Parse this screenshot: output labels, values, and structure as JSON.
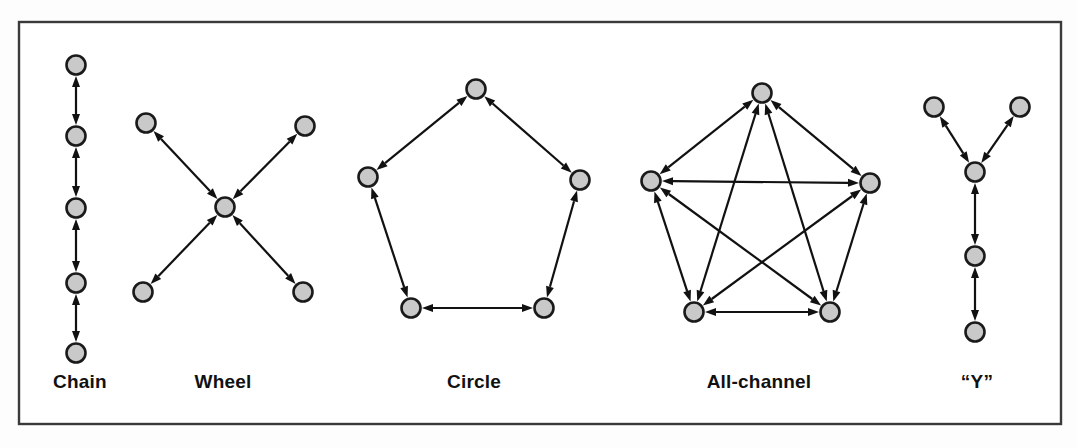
{
  "figure": {
    "background_color": "#fdfdfd",
    "frame": {
      "name": "figure-border",
      "stroke_color": "#3a3a3a",
      "fill_color": "#ffffff",
      "x": 19,
      "y": 22,
      "width": 1042,
      "height": 402
    },
    "style": {
      "node_fill": "#c9c9c9",
      "node_stroke": "#1a1a1a",
      "node_radius": 9.5,
      "node_stroke_width": 2.6,
      "edge_color": "#111111",
      "edge_width": 2.2,
      "arrow_color": "#111111",
      "label_color": "#111111"
    }
  },
  "networks": [
    {
      "id": "chain",
      "label": "Chain",
      "label_x": 80,
      "label_y": 388,
      "description": "Five nodes in a vertical line, each adjacent pair linked by a two-way arrow",
      "node_count": 5,
      "edge_count": 4,
      "nodes": [
        {
          "id": "c1",
          "x": 76,
          "y": 65
        },
        {
          "id": "c2",
          "x": 76,
          "y": 136
        },
        {
          "id": "c3",
          "x": 76,
          "y": 208
        },
        {
          "id": "c4",
          "x": 76,
          "y": 283
        },
        {
          "id": "c5",
          "x": 76,
          "y": 353
        }
      ],
      "edges": [
        {
          "from": "c1",
          "to": "c2",
          "bidirectional": true
        },
        {
          "from": "c2",
          "to": "c3",
          "bidirectional": true
        },
        {
          "from": "c3",
          "to": "c4",
          "bidirectional": true
        },
        {
          "from": "c4",
          "to": "c5",
          "bidirectional": true
        }
      ]
    },
    {
      "id": "wheel",
      "label": "Wheel",
      "label_x": 223,
      "label_y": 388,
      "description": "One central node linked by two-way arrows to four peripheral nodes arranged in an X",
      "node_count": 5,
      "edge_count": 4,
      "nodes": [
        {
          "id": "w_center",
          "x": 225,
          "y": 207
        },
        {
          "id": "w_tl",
          "x": 146,
          "y": 123
        },
        {
          "id": "w_tr",
          "x": 305,
          "y": 126
        },
        {
          "id": "w_bl",
          "x": 143,
          "y": 292
        },
        {
          "id": "w_br",
          "x": 303,
          "y": 292
        }
      ],
      "edges": [
        {
          "from": "w_center",
          "to": "w_tl",
          "bidirectional": true
        },
        {
          "from": "w_center",
          "to": "w_tr",
          "bidirectional": true
        },
        {
          "from": "w_center",
          "to": "w_bl",
          "bidirectional": true
        },
        {
          "from": "w_center",
          "to": "w_br",
          "bidirectional": true
        }
      ]
    },
    {
      "id": "circle",
      "label": "Circle",
      "label_x": 474,
      "label_y": 388,
      "description": "Five nodes on a pentagon ring, each linked to its two neighbours by two-way arrows",
      "node_count": 5,
      "edge_count": 5,
      "nodes": [
        {
          "id": "r_top",
          "x": 476,
          "y": 89
        },
        {
          "id": "r_left",
          "x": 368,
          "y": 177
        },
        {
          "id": "r_right",
          "x": 580,
          "y": 180
        },
        {
          "id": "r_bl",
          "x": 411,
          "y": 308
        },
        {
          "id": "r_br",
          "x": 544,
          "y": 308
        }
      ],
      "edges": [
        {
          "from": "r_top",
          "to": "r_left",
          "bidirectional": true
        },
        {
          "from": "r_top",
          "to": "r_right",
          "bidirectional": true
        },
        {
          "from": "r_left",
          "to": "r_bl",
          "bidirectional": true
        },
        {
          "from": "r_right",
          "to": "r_br",
          "bidirectional": true
        },
        {
          "from": "r_bl",
          "to": "r_br",
          "bidirectional": true
        }
      ]
    },
    {
      "id": "all-channel",
      "label": "All-channel",
      "label_x": 759,
      "label_y": 388,
      "description": "Five nodes fully connected: every pair linked by a two-way arrow",
      "node_count": 5,
      "edge_count": 10,
      "nodes": [
        {
          "id": "a_top",
          "x": 762,
          "y": 93
        },
        {
          "id": "a_left",
          "x": 651,
          "y": 181
        },
        {
          "id": "a_right",
          "x": 870,
          "y": 183
        },
        {
          "id": "a_bl",
          "x": 694,
          "y": 312
        },
        {
          "id": "a_br",
          "x": 830,
          "y": 312
        }
      ],
      "edges": [
        {
          "from": "a_top",
          "to": "a_left",
          "bidirectional": true
        },
        {
          "from": "a_top",
          "to": "a_right",
          "bidirectional": true
        },
        {
          "from": "a_top",
          "to": "a_bl",
          "bidirectional": true
        },
        {
          "from": "a_top",
          "to": "a_br",
          "bidirectional": true
        },
        {
          "from": "a_left",
          "to": "a_right",
          "bidirectional": true
        },
        {
          "from": "a_left",
          "to": "a_bl",
          "bidirectional": true
        },
        {
          "from": "a_left",
          "to": "a_br",
          "bidirectional": true
        },
        {
          "from": "a_right",
          "to": "a_bl",
          "bidirectional": true
        },
        {
          "from": "a_right",
          "to": "a_br",
          "bidirectional": true
        },
        {
          "from": "a_bl",
          "to": "a_br",
          "bidirectional": true
        }
      ]
    },
    {
      "id": "y",
      "label": "“Y”",
      "label_x": 977,
      "label_y": 388,
      "description": "Two upper nodes converge on a junction node, which continues down a two-node tail",
      "node_count": 5,
      "edge_count": 4,
      "nodes": [
        {
          "id": "y_tl",
          "x": 934,
          "y": 107
        },
        {
          "id": "y_tr",
          "x": 1020,
          "y": 107
        },
        {
          "id": "y_junction",
          "x": 975,
          "y": 172
        },
        {
          "id": "y_mid",
          "x": 975,
          "y": 256
        },
        {
          "id": "y_bottom",
          "x": 975,
          "y": 332
        }
      ],
      "edges": [
        {
          "from": "y_junction",
          "to": "y_tl",
          "bidirectional": true
        },
        {
          "from": "y_junction",
          "to": "y_tr",
          "bidirectional": true
        },
        {
          "from": "y_junction",
          "to": "y_mid",
          "bidirectional": true
        },
        {
          "from": "y_mid",
          "to": "y_bottom",
          "bidirectional": true
        }
      ]
    }
  ]
}
